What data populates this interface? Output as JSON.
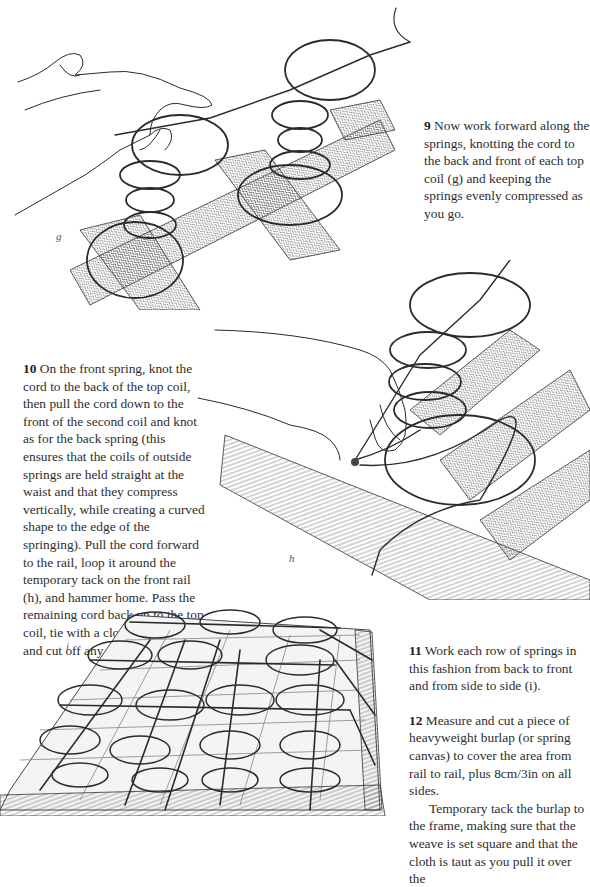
{
  "page": {
    "type": "instruction-page"
  },
  "figures": [
    {
      "id": "g",
      "label": "g",
      "caption": "Hand knotting cord to top coils of back springs on webbing"
    },
    {
      "id": "h",
      "label": "h",
      "caption": "Cord looped around temporary tack on front rail"
    },
    {
      "id": "i",
      "label": "i",
      "caption": "Full frame with each row of springs tied back to front and side to side"
    }
  ],
  "steps": [
    {
      "number": "9",
      "text": "Now work forward along the springs, knotting the cord to the back and front of each top coil (g) and keeping the springs evenly compressed as you go."
    },
    {
      "number": "10",
      "text": "On the front spring, knot the cord to the back of the top coil, then pull the cord down to the front of the second coil and knot as for the back spring (this ensures that the coils of outside springs are held straight at the waist and that they compress vertically, while creating a curved shape to the edge of the springing). Pull the cord forward to the rail, loop it around the temporary tack on the front rail (h), and hammer home. Pass the remaining cord back up to the top coil, tie with a clove hitch knot, and cut off any spare cord."
    },
    {
      "number": "11",
      "text": "Work each row of springs in this fashion from back to front and from side to side (i)."
    },
    {
      "number": "12",
      "text": "Measure and cut a piece of heavyweight burlap (or spring canvas) to cover the area from rail to rail, plus 8cm/3in on all sides.",
      "continuation": "Temporary tack the burlap to the frame, making sure that the weave is set square and that the cloth is taut as you pull it over the"
    }
  ]
}
